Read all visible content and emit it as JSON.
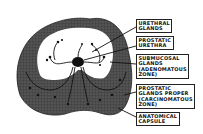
{
  "diagram": {
    "colors": {
      "outer_zone": "#4a4a4a",
      "inner_zone": "#ffffff",
      "lines": "#111111",
      "background": "#ffffff"
    },
    "labels": [
      {
        "lines": [
          "URETHRAL",
          "GLANDS"
        ]
      },
      {
        "lines": [
          "PROSTATIC",
          "URETHRA"
        ]
      },
      {
        "lines": [
          "SUBMUCOSAL",
          "GLANDS",
          "(ADENOMATOUS",
          "ZONE)"
        ]
      },
      {
        "lines": [
          "PROSTATIC",
          "GLANDS PROPER",
          "(CARCINOMATOUS",
          "ZONE)"
        ]
      },
      {
        "lines": [
          "ANATOMICAL",
          "CAPSULE"
        ]
      }
    ]
  }
}
